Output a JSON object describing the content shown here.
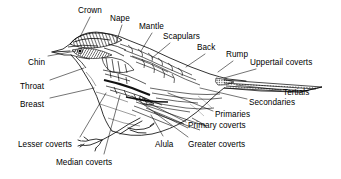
{
  "diagram": {
    "style": "black-and-white line drawing with leader lines",
    "ink_color": "#000000",
    "background_color": "#ffffff",
    "labels": [
      {
        "id": "crown",
        "text": "Crown",
        "x": 78,
        "y": 6,
        "anchor": "start"
      },
      {
        "id": "nape",
        "text": "Nape",
        "x": 110,
        "y": 14,
        "anchor": "start"
      },
      {
        "id": "mantle",
        "text": "Mantle",
        "x": 139,
        "y": 22,
        "anchor": "start"
      },
      {
        "id": "scapulars",
        "text": "Scapulars",
        "x": 163,
        "y": 32,
        "anchor": "start"
      },
      {
        "id": "back",
        "text": "Back",
        "x": 197,
        "y": 43,
        "anchor": "start"
      },
      {
        "id": "rump",
        "text": "Rump",
        "x": 226,
        "y": 50,
        "anchor": "start"
      },
      {
        "id": "uppertail-coverts",
        "text": "Uppertail coverts",
        "x": 250,
        "y": 58,
        "anchor": "start"
      },
      {
        "id": "tertials",
        "text": "Tertials",
        "x": 283,
        "y": 88,
        "anchor": "start"
      },
      {
        "id": "secondaries",
        "text": "Secondaries",
        "x": 249,
        "y": 98,
        "anchor": "start"
      },
      {
        "id": "primaries",
        "text": "Primaries",
        "x": 215,
        "y": 110,
        "anchor": "start"
      },
      {
        "id": "primary-coverts",
        "text": "Primary coverts",
        "x": 188,
        "y": 121,
        "anchor": "start"
      },
      {
        "id": "greater-coverts",
        "text": "Greater coverts",
        "x": 188,
        "y": 140,
        "anchor": "start"
      },
      {
        "id": "alula",
        "text": "Alula",
        "x": 155,
        "y": 140,
        "anchor": "start"
      },
      {
        "id": "median-coverts",
        "text": "Median coverts",
        "x": 56,
        "y": 158,
        "anchor": "start"
      },
      {
        "id": "lesser-coverts",
        "text": "Lesser coverts",
        "x": 18,
        "y": 140,
        "anchor": "start"
      },
      {
        "id": "breast",
        "text": "Breast",
        "x": 20,
        "y": 100,
        "anchor": "start"
      },
      {
        "id": "throat",
        "text": "Throat",
        "x": 20,
        "y": 82,
        "anchor": "start"
      },
      {
        "id": "chin",
        "text": "Chin",
        "x": 28,
        "y": 58,
        "anchor": "start"
      }
    ],
    "leader_lines": [
      {
        "id": "leader-crown",
        "points": "90,17 80,37"
      },
      {
        "id": "leader-nape",
        "points": "122,25 116,43"
      },
      {
        "id": "leader-mantle",
        "points": "152,33 141,51"
      },
      {
        "id": "leader-scapulars",
        "points": "170,43 152,58"
      },
      {
        "id": "leader-back",
        "points": "205,54 186,67"
      },
      {
        "id": "leader-rump",
        "points": "233,61 218,72"
      },
      {
        "id": "leader-uppertail-coverts",
        "points": "256,69 224,78"
      },
      {
        "id": "leader-tertials",
        "points": "281,90 236,85"
      },
      {
        "id": "leader-secondaries",
        "points": "247,99 200,88"
      },
      {
        "id": "leader-primaries",
        "points": "213,111 168,93"
      },
      {
        "id": "leader-primary-coverts",
        "points": "186,122 139,98"
      },
      {
        "id": "leader-greater-coverts",
        "points": "188,137 132,96"
      },
      {
        "id": "leader-alula",
        "points": "163,136 151,115"
      },
      {
        "id": "leader-median-coverts",
        "points": "104,154 120,95"
      },
      {
        "id": "leader-lesser-coverts",
        "points": "80,137 106,93"
      },
      {
        "id": "leader-breast",
        "points": "50,98 94,88"
      },
      {
        "id": "leader-throat",
        "points": "50,80 84,68"
      },
      {
        "id": "leader-chin",
        "points": "48,56 76,51"
      }
    ]
  }
}
